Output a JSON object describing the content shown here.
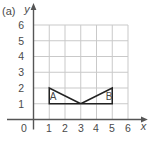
{
  "figure_label": "(a)",
  "axes": {
    "x_label": "x",
    "y_label": "y",
    "x_range": [
      0,
      6
    ],
    "y_range": [
      0,
      6
    ],
    "x_tick_labels": [
      "0",
      "1",
      "2",
      "3",
      "4",
      "5",
      "6"
    ],
    "y_tick_labels": [
      "1",
      "2",
      "3",
      "4",
      "5",
      "6"
    ]
  },
  "shapes": [
    {
      "name": "A",
      "vertices": [
        [
          1,
          1
        ],
        [
          1,
          2
        ],
        [
          3,
          1
        ]
      ]
    },
    {
      "name": "B",
      "vertices": [
        [
          3,
          1
        ],
        [
          5,
          1
        ],
        [
          5,
          2
        ]
      ]
    }
  ],
  "colors": {
    "background": "#ffffff",
    "grid": "#c9c9c9",
    "axis": "#555555",
    "shape_stroke": "#222222",
    "text": "#4a4a4a"
  }
}
